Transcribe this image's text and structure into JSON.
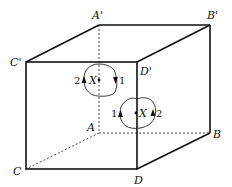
{
  "diagram": {
    "type": "cube-with-loops",
    "vertices": {
      "A_prime": {
        "label": "A'",
        "x": 99,
        "y": 25
      },
      "B_prime": {
        "label": "B'",
        "x": 210,
        "y": 25
      },
      "C_prime": {
        "label": "C'",
        "x": 26,
        "y": 62
      },
      "D_prime": {
        "label": "D'",
        "x": 137,
        "y": 62
      },
      "A": {
        "label": "A",
        "x": 99,
        "y": 133
      },
      "B": {
        "label": "B",
        "x": 210,
        "y": 133
      },
      "C": {
        "label": "C",
        "x": 26,
        "y": 169
      },
      "D": {
        "label": "D",
        "x": 137,
        "y": 169
      }
    },
    "edges_solid": [
      [
        "A'",
        "B'"
      ],
      [
        "C'",
        "D'"
      ],
      [
        "A'",
        "C'"
      ],
      [
        "B'",
        "D'"
      ],
      [
        "C'",
        "C"
      ],
      [
        "D'",
        "D"
      ],
      [
        "B'",
        "B"
      ],
      [
        "C",
        "D"
      ],
      [
        "D",
        "B"
      ]
    ],
    "edges_dashed": [
      [
        "A'",
        "A"
      ],
      [
        "A",
        "B"
      ],
      [
        "A",
        "C"
      ]
    ],
    "loops": [
      {
        "point_label": "X",
        "left_arrow_label": "2",
        "right_arrow_label": "1",
        "left_arrow_dir": "up",
        "right_arrow_dir": "down"
      },
      {
        "point_label": "X",
        "left_arrow_label": "1",
        "right_arrow_label": "2",
        "left_arrow_dir": "up",
        "right_arrow_dir": "up"
      }
    ]
  }
}
